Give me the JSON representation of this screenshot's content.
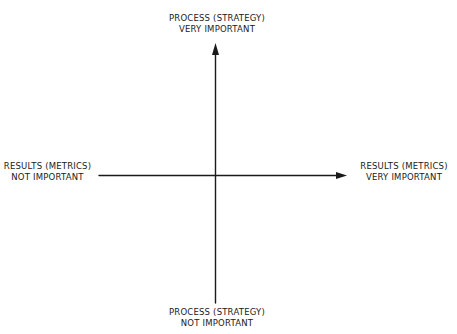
{
  "diagram": {
    "type": "quadrant",
    "colors": {
      "ink": "#1a1a1a",
      "background": "#ffffff"
    },
    "axes": {
      "vertical": {
        "name": "Process (Strategy)",
        "top_label": {
          "line1": "Process (Strategy)",
          "line2": "Very Important"
        },
        "bottom_label": {
          "line1": "Process (Strategy)",
          "line2": "Not Important"
        }
      },
      "horizontal": {
        "name": "Results (Metrics)",
        "left_label": {
          "line1": "Results (Metrics)",
          "line2": "Not Important"
        },
        "right_label": {
          "line1": "Results (Metrics)",
          "line2": "Very Important"
        }
      }
    },
    "arrows": [
      {
        "direction": "up",
        "axis": "vertical"
      },
      {
        "direction": "right",
        "axis": "horizontal"
      }
    ]
  }
}
